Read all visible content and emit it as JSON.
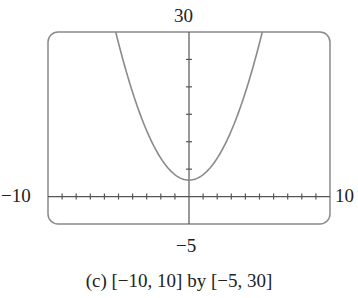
{
  "chart_data": {
    "type": "line",
    "title": "",
    "caption": "(c) [−10, 10] by [−5, 30]",
    "function": "y = x^2 + 3",
    "xlim": [
      -10,
      10
    ],
    "ylim": [
      -5,
      30
    ],
    "x_tick_step": 1,
    "y_tick_step": 5,
    "grid": false,
    "legend": null,
    "series": [
      {
        "name": "parabola",
        "x": [
          -5.2,
          -5,
          -4,
          -3,
          -2,
          -1,
          0,
          1,
          2,
          3,
          4,
          5,
          5.2
        ],
        "y": [
          30,
          28,
          19,
          12,
          7,
          4,
          3,
          4,
          7,
          12,
          19,
          28,
          30
        ]
      }
    ],
    "window_labels": {
      "ymax": "30",
      "ymin": "−5",
      "xmin": "−10",
      "xmax": "10"
    }
  },
  "labels": {
    "ymax": "30",
    "ymin": "−5",
    "xmin": "−10",
    "xmax": "10",
    "caption": "(c) [−10, 10] by [−5, 30]"
  },
  "colors": {
    "frame": "#8a8a8a",
    "axis": "#555555",
    "curve": "#8a8a8a"
  }
}
